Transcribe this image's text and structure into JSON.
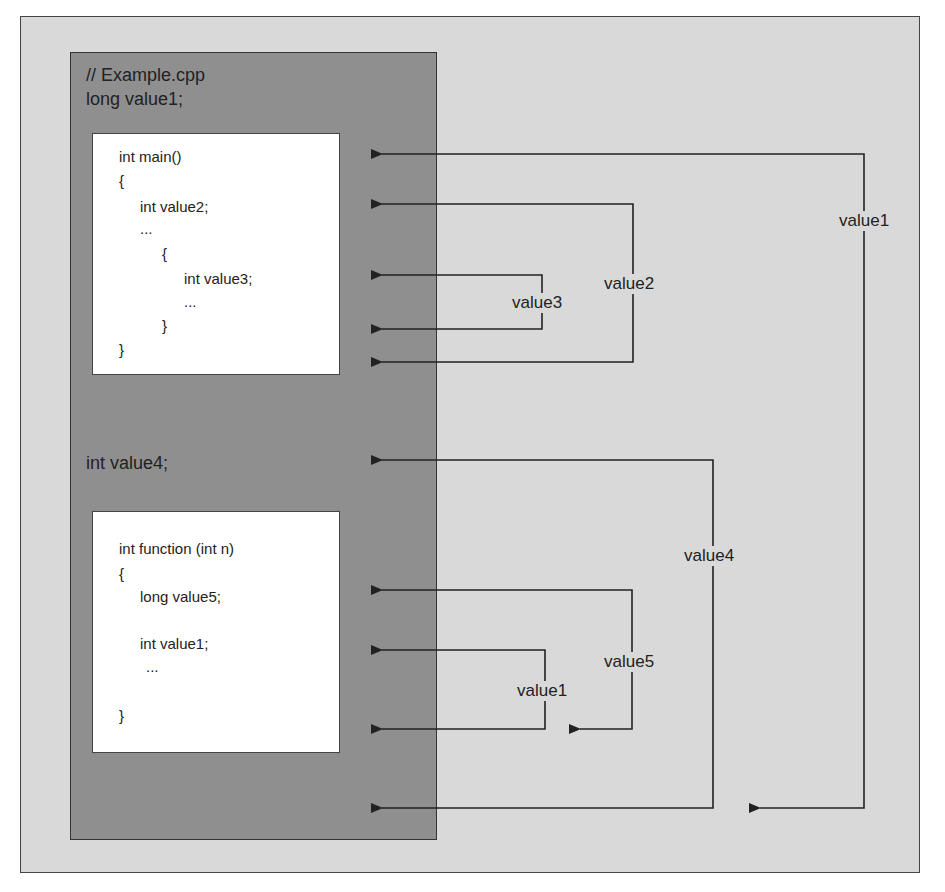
{
  "diagram": {
    "global_scope": {
      "lines": [
        "// Example.cpp",
        "long value1;",
        "int value4;"
      ]
    },
    "main_block": {
      "lines": [
        "int main()",
        "{",
        "int value2;",
        "...",
        "{",
        "int value3;",
        "...",
        "}",
        "}"
      ]
    },
    "function_block": {
      "lines": [
        "int function (int n)",
        "{",
        "long value5;",
        "int value1;",
        "...",
        "}"
      ]
    },
    "scope_labels": {
      "value1_global": "value1",
      "value2": "value2",
      "value3": "value3",
      "value4": "value4",
      "value5": "value5",
      "value1_local": "value1"
    },
    "colors": {
      "background": "#d9d9d9",
      "global_panel": "#8f8f8f",
      "code_block": "#ffffff",
      "line": "#222222"
    }
  }
}
